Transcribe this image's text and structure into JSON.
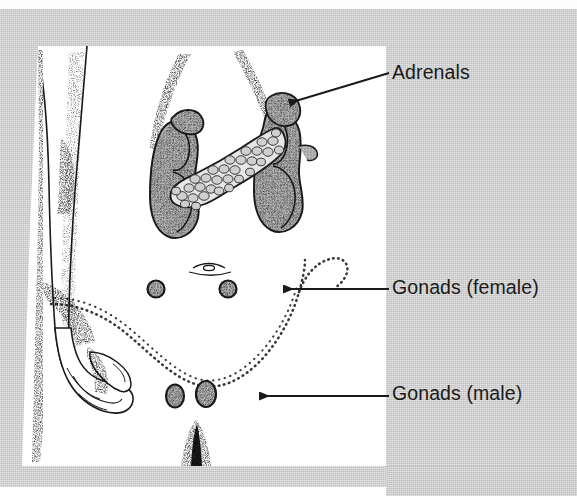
{
  "figure": {
    "kind": "anatomical-illustration",
    "background_color": "#c9c9c9",
    "panel_color": "#ffffff",
    "ink_color": "#1a1a1a",
    "organ_fill_color": "#a8a8a8"
  },
  "labels": [
    {
      "id": "adrenals",
      "text": "Adrenals",
      "leader": {
        "from_x": 389,
        "from_y": 73,
        "to_x": 287,
        "to_y": 104,
        "arrow": "left-down"
      }
    },
    {
      "id": "gonads_female",
      "text": "Gonads (female)",
      "leader": {
        "from_x": 389,
        "from_y": 289,
        "to_x": 281,
        "to_y": 289,
        "arrow": "left"
      }
    },
    {
      "id": "gonads_male",
      "text": "Gonads (male)",
      "leader": {
        "from_x": 389,
        "from_y": 396,
        "to_x": 258,
        "to_y": 396,
        "arrow": "left"
      }
    }
  ],
  "structures": [
    {
      "id": "left-arm",
      "name": "arm-and-hand",
      "shading": "stippled-outline"
    },
    {
      "id": "rib-outline",
      "name": "lower-rib-cage-outline",
      "shading": "stippled-dotted"
    },
    {
      "id": "kidney-left",
      "name": "kidney",
      "shading": "stippled-fill"
    },
    {
      "id": "kidney-right",
      "name": "kidney",
      "shading": "stippled-fill"
    },
    {
      "id": "pancreas",
      "name": "pancreas",
      "shading": "lobulated-outline"
    },
    {
      "id": "adrenal-left",
      "name": "adrenal-gland",
      "shading": "stippled-fill"
    },
    {
      "id": "adrenal-right",
      "name": "adrenal-gland",
      "shading": "stippled-fill"
    },
    {
      "id": "navel",
      "name": "navel",
      "shading": "line"
    },
    {
      "id": "pelvic-outline",
      "name": "pelvic-brim-outline",
      "shading": "dotted"
    },
    {
      "id": "ovary-left",
      "name": "ovary",
      "shading": "stippled-fill"
    },
    {
      "id": "ovary-right",
      "name": "ovary",
      "shading": "stippled-fill"
    },
    {
      "id": "testis-left",
      "name": "testis",
      "shading": "stippled-fill"
    },
    {
      "id": "testis-right",
      "name": "testis",
      "shading": "stippled-fill"
    },
    {
      "id": "midline-mark",
      "name": "midline-marker",
      "shading": "stippled"
    }
  ]
}
